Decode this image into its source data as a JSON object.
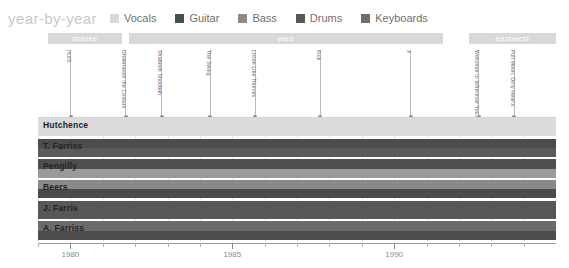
{
  "header": {
    "title": "year-by-year",
    "legend": [
      {
        "label": "Vocals",
        "color": "#d9d9d9",
        "key": "vocals"
      },
      {
        "label": "Guitar",
        "color": "#4c4c4c",
        "key": "guitar"
      },
      {
        "label": "Bass",
        "color": "#8a8a8a",
        "key": "bass"
      },
      {
        "label": "Drums",
        "color": "#585858",
        "key": "drums"
      },
      {
        "label": "Keyboards",
        "color": "#6e6e6e",
        "key": "keyboards"
      }
    ]
  },
  "colors": {
    "vocals": "#d9d9d9",
    "guitar": "#4c4c4c",
    "bass": "#8a8a8a",
    "drums": "#585858",
    "keyboards": "#6e6e6e",
    "band_band": "#d8d8d8",
    "grid": "#e6e6e6",
    "axis": "#9a9a9a",
    "marker": "#b9b9b9"
  },
  "labels_bands": [
    {
      "name": "deluxe",
      "start": 1979.3,
      "end": 1981.6
    },
    {
      "name": "wea",
      "start": 1981.8,
      "end": 1991.5
    },
    {
      "name": "eastwest",
      "start": 1992.3,
      "end": 1995.0
    }
  ],
  "albums": [
    {
      "title": "INXS",
      "year": 1980.0
    },
    {
      "title": "Underneath the Colours",
      "year": 1981.7
    },
    {
      "title": "Shabooh Shoobah",
      "year": 1982.8
    },
    {
      "title": "The Swing",
      "year": 1984.3
    },
    {
      "title": "Listen Like Thieves",
      "year": 1985.7
    },
    {
      "title": "Kick",
      "year": 1987.7
    },
    {
      "title": "X",
      "year": 1990.5
    },
    {
      "title": "Welcome to Wherever You Are",
      "year": 1992.6
    },
    {
      "title": "Full Moon, Dirty Hearts",
      "year": 1993.7
    }
  ],
  "chart_data": {
    "type": "bar",
    "title": "year-by-year",
    "xlabel": "",
    "ylabel": "",
    "xlim": [
      1979,
      1995
    ],
    "grid": true,
    "legend_position": "top",
    "xticks_major": [
      1980,
      1985,
      1990
    ],
    "xticks_minor": [
      1979,
      1981,
      1982,
      1983,
      1984,
      1986,
      1987,
      1988,
      1989,
      1991,
      1992,
      1993,
      1994
    ],
    "categories": [
      "Hutchence",
      "T. Farriss",
      "Pengilly",
      "Beers",
      "J. Farris",
      "A. Farriss"
    ],
    "series": [
      {
        "name": "Hutchence",
        "bars": [
          {
            "instrument": "vocals",
            "start": 1979,
            "end": 1995,
            "color": "#dcdcdc"
          }
        ]
      },
      {
        "name": "T. Farriss",
        "bars": [
          {
            "instrument": "guitar",
            "start": 1979,
            "end": 1995,
            "color": "#4c4c4c"
          },
          {
            "instrument": "keyboards",
            "start": 1979,
            "end": 1995,
            "color": "#5a5a5a"
          }
        ]
      },
      {
        "name": "Pengilly",
        "bars": [
          {
            "instrument": "guitar",
            "start": 1979,
            "end": 1995,
            "color": "#4f4f4f"
          },
          {
            "instrument": "bass",
            "start": 1979,
            "end": 1995,
            "color": "#9a9a9a"
          }
        ]
      },
      {
        "name": "Beers",
        "bars": [
          {
            "instrument": "bass",
            "start": 1979,
            "end": 1995,
            "color": "#8a8a8a"
          },
          {
            "instrument": "guitar",
            "start": 1979,
            "end": 1995,
            "color": "#4a4a4a"
          }
        ]
      },
      {
        "name": "J. Farris",
        "bars": [
          {
            "instrument": "drums",
            "start": 1979,
            "end": 1995,
            "color": "#575757"
          }
        ]
      },
      {
        "name": "A. Farriss",
        "bars": [
          {
            "instrument": "keyboards",
            "start": 1979,
            "end": 1995,
            "color": "#6b6b6b"
          },
          {
            "instrument": "guitar",
            "start": 1979,
            "end": 1995,
            "color": "#4c4c4c"
          }
        ]
      }
    ]
  }
}
